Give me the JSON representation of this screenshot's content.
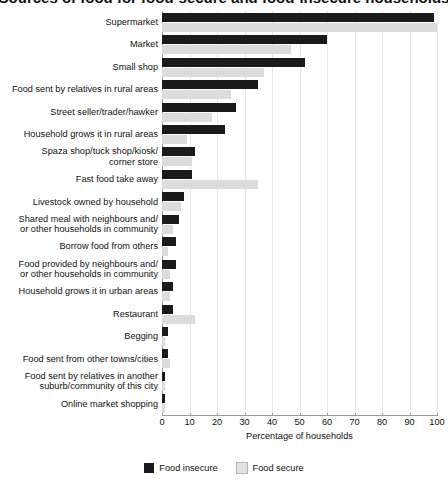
{
  "title": "Sources of food for food-secure and food-insecure households",
  "chart_data": {
    "type": "bar",
    "orientation": "horizontal",
    "title": "Sources of food for food-secure and food-insecure households",
    "xlabel": "Percentage of households",
    "ylabel": "",
    "xlim": [
      0,
      100
    ],
    "xticks": [
      0,
      10,
      20,
      30,
      40,
      50,
      60,
      70,
      80,
      90,
      100
    ],
    "grid": true,
    "grid_axis": "x",
    "legend_position": "bottom-center",
    "categories": [
      "Supermarket",
      "Market",
      "Small shop",
      "Food sent by relatives in rural areas",
      "Street seller/trader/hawker",
      "Household grows it in rural areas",
      "Spaza shop/tuck shop/kiosk/ corner store",
      "Fast food take away",
      "Livestock owned by household",
      "Shared meal with neighbours and/ or other households in community",
      "Borrow food from others",
      "Food provided by neighbours and/ or other households in community",
      "Household grows it in urban areas",
      "Restaurant",
      "Begging",
      "Food sent from other towns/cities",
      "Food sent by relatives in another suburb/community of this city",
      "Online market shopping"
    ],
    "series": [
      {
        "name": "Food insecure",
        "color": "#1a1a1a",
        "values": [
          99,
          60,
          52,
          35,
          27,
          23,
          12,
          11,
          8,
          6,
          5,
          5,
          4,
          4,
          2,
          2,
          1,
          1
        ]
      },
      {
        "name": "Food secure",
        "color": "#dcdcdc",
        "values": [
          100,
          47,
          37,
          25,
          18,
          9,
          11,
          35,
          7,
          4,
          2,
          3,
          3,
          12,
          1,
          3,
          1,
          1
        ]
      }
    ]
  },
  "axis": {
    "x_label": "Percentage of households",
    "x_tick_labels": [
      "0",
      "10",
      "20",
      "30",
      "40",
      "50",
      "60",
      "70",
      "80",
      "90",
      "100"
    ]
  },
  "categories": [
    {
      "lines": [
        "Supermarket"
      ]
    },
    {
      "lines": [
        "Market"
      ]
    },
    {
      "lines": [
        "Small shop"
      ]
    },
    {
      "lines": [
        "Food sent by relatives in rural areas"
      ]
    },
    {
      "lines": [
        "Street seller/trader/hawker"
      ]
    },
    {
      "lines": [
        "Household grows it in rural areas"
      ]
    },
    {
      "lines": [
        "Spaza shop/tuck shop/kiosk/",
        "corner store"
      ]
    },
    {
      "lines": [
        "Fast food take away"
      ]
    },
    {
      "lines": [
        "Livestock owned by household"
      ]
    },
    {
      "lines": [
        "Shared meal with neighbours and/",
        "or other households in community"
      ]
    },
    {
      "lines": [
        "Borrow food from others"
      ]
    },
    {
      "lines": [
        "Food provided by neighbours and/",
        "or other households in community"
      ]
    },
    {
      "lines": [
        "Household grows it in urban areas"
      ]
    },
    {
      "lines": [
        "Restaurant"
      ]
    },
    {
      "lines": [
        "Begging"
      ]
    },
    {
      "lines": [
        "Food sent from other towns/cities"
      ]
    },
    {
      "lines": [
        "Food sent by relatives in another",
        "suburb/community of this city"
      ]
    },
    {
      "lines": [
        "Online market shopping"
      ]
    }
  ],
  "legend": {
    "items": [
      {
        "label": "Food insecure",
        "color": "#1a1a1a"
      },
      {
        "label": "Food secure",
        "color": "#e2e2e2"
      }
    ]
  }
}
